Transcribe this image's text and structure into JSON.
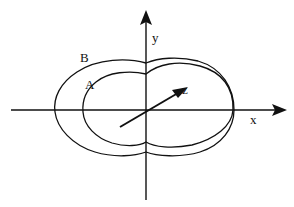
{
  "diagram": {
    "axes": {
      "x_label": "x",
      "y_label": "y",
      "z_label": "z"
    },
    "curves": [
      {
        "id": "B",
        "label": "B",
        "role": "outer pattern"
      },
      {
        "id": "A",
        "label": "A",
        "role": "inner pattern"
      }
    ],
    "colors": {
      "stroke": "#111111",
      "background": "#ffffff"
    }
  }
}
